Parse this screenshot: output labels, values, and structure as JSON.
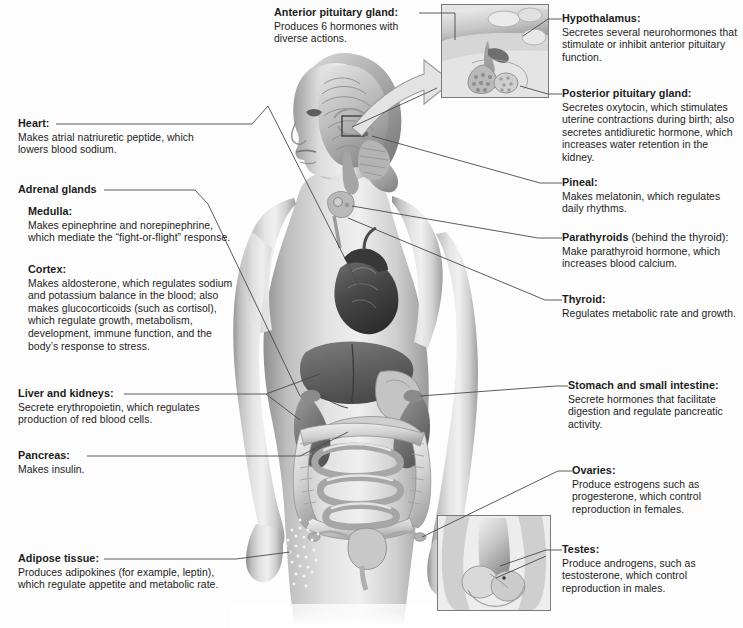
{
  "diagram": {
    "background_color": "#fdfdfd",
    "leader_line_color": "#4a4a4a",
    "text_color": "#1c1c1c"
  },
  "insets": [
    {
      "id": "pituitary-inset",
      "caption": "Magnified view of hypothalamus and pituitary gland",
      "frame_color": "#7a7a7a"
    },
    {
      "id": "testes-inset",
      "caption": "Male reproductive anatomy showing testes",
      "frame_color": "#7a7a7a"
    }
  ],
  "figure": {
    "organs": [
      "brain",
      "pineal gland",
      "pituitary gland",
      "thyroid",
      "parathyroids",
      "heart",
      "liver",
      "kidneys",
      "adrenal glands",
      "stomach",
      "pancreas",
      "small intestine",
      "large intestine",
      "ovaries",
      "uterus",
      "adipose tissue"
    ]
  },
  "labels": {
    "anterior_pituitary": {
      "title": "Anterior pituitary gland:",
      "body": "Produces 6 hormones with diverse actions."
    },
    "hypothalamus": {
      "title": "Hypothalamus:",
      "body": "Secretes several neurohormones that stimulate or inhibit anterior pituitary function."
    },
    "posterior_pituitary": {
      "title": "Posterior pituitary gland:",
      "body": "Secretes oxytocin, which stimulates uterine contractions during birth; also secretes antidiuretic hormone, which increases water retention in the kidney."
    },
    "pineal": {
      "title": "Pineal:",
      "body": "Makes melatonin, which regulates daily rhythms."
    },
    "parathyroids": {
      "title": "Parathyroids",
      "title_sub": " (behind the thyroid):",
      "body": "Make parathyroid hormone, which increases blood calcium."
    },
    "thyroid": {
      "title": "Thyroid:",
      "body": "Regulates metabolic rate and growth."
    },
    "heart": {
      "title": "Heart:",
      "body": "Makes atrial natriuretic peptide, which lowers blood sodium."
    },
    "adrenal_glands": {
      "title": "Adrenal glands"
    },
    "medulla": {
      "title": "Medulla:",
      "body": "Makes epinephrine and norepinephrine, which mediate the “fight-or-flight” response."
    },
    "cortex": {
      "title": "Cortex:",
      "body": "Makes aldosterone, which regulates sodium and potassium balance in the blood; also makes glucocorticoids (such as cortisol), which regulate growth, metabolism, development, immune function, and the body’s response to stress."
    },
    "liver_kidneys": {
      "title": "Liver and kidneys:",
      "body": "Secrete erythropoietin, which regulates production of red blood cells."
    },
    "pancreas": {
      "title": "Pancreas:",
      "body": "Makes insulin."
    },
    "adipose": {
      "title": "Adipose tissue:",
      "body": "Produces adipokines (for example, leptin), which regulate appetite and metabolic rate."
    },
    "stomach_intestine": {
      "title": "Stomach and small intestine:",
      "body": "Secrete hormones that facilitate digestion and regulate pancreatic activity."
    },
    "ovaries": {
      "title": "Ovaries:",
      "body": "Produce estrogens such as progesterone, which control reproduction in females."
    },
    "testes": {
      "title": "Testes:",
      "body": "Produce androgens, such as testosterone, which control reproduction in males."
    }
  }
}
